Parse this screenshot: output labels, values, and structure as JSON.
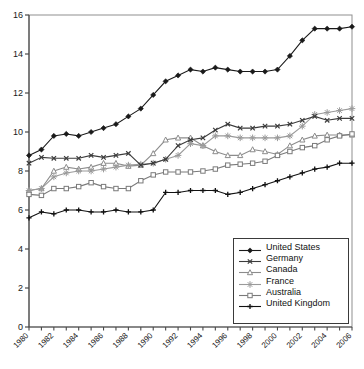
{
  "chart_data": {
    "type": "line",
    "title": "",
    "subtitle": "",
    "xlabel": "",
    "ylabel": "",
    "xlim": [
      1980,
      2006
    ],
    "ylim": [
      0,
      16
    ],
    "grid": false,
    "legend_position": "bottom-right",
    "x": [
      1980,
      1981,
      1982,
      1983,
      1984,
      1985,
      1986,
      1987,
      1988,
      1989,
      1990,
      1991,
      1992,
      1993,
      1994,
      1995,
      1996,
      1997,
      1998,
      1999,
      2000,
      2001,
      2002,
      2003,
      2004,
      2005,
      2006
    ],
    "xticks": [
      "1980",
      "1982",
      "1984",
      "1986",
      "1988",
      "1990",
      "1992",
      "1994",
      "1996",
      "1998",
      "2000",
      "2002",
      "2004",
      "2006"
    ],
    "yticks": [
      "0",
      "2",
      "4",
      "6",
      "8",
      "10",
      "12",
      "14",
      "16"
    ],
    "series": [
      {
        "name": "United States",
        "marker": "diamond",
        "color": "#1a1a1a",
        "values": [
          8.8,
          9.1,
          9.8,
          9.9,
          9.8,
          10.0,
          10.2,
          10.4,
          10.8,
          11.2,
          11.9,
          12.6,
          12.9,
          13.2,
          13.1,
          13.3,
          13.2,
          13.1,
          13.1,
          13.1,
          13.2,
          13.9,
          14.7,
          15.3,
          15.3,
          15.3,
          15.4
        ]
      },
      {
        "name": "Germany",
        "marker": "x",
        "color": "#3c3c3c",
        "values": [
          8.4,
          8.7,
          8.65,
          8.65,
          8.65,
          8.8,
          8.7,
          8.8,
          8.9,
          8.3,
          8.4,
          8.6,
          9.3,
          9.6,
          9.7,
          10.1,
          10.4,
          10.2,
          10.2,
          10.3,
          10.3,
          10.4,
          10.6,
          10.8,
          10.6,
          10.7,
          10.7
        ]
      },
      {
        "name": "Canada",
        "marker": "triangle",
        "color": "#8c8c8c",
        "values": [
          7.0,
          7.1,
          8.0,
          8.2,
          8.1,
          8.2,
          8.4,
          8.4,
          8.25,
          8.3,
          8.9,
          9.6,
          9.7,
          9.7,
          9.3,
          9.0,
          8.8,
          8.8,
          9.1,
          9.0,
          8.85,
          9.3,
          9.6,
          9.8,
          9.85,
          9.85,
          9.85
        ]
      },
      {
        "name": "France",
        "marker": "asterisk",
        "color": "#9a9a9a",
        "values": [
          7.0,
          7.1,
          7.7,
          7.9,
          8.0,
          8.0,
          8.1,
          8.2,
          8.3,
          8.35,
          8.4,
          8.6,
          8.8,
          9.4,
          9.3,
          9.8,
          9.8,
          9.7,
          9.7,
          9.7,
          9.7,
          9.8,
          10.3,
          10.9,
          11.0,
          11.1,
          11.2
        ]
      },
      {
        "name": "Australia",
        "marker": "square",
        "color": "#7a7a7a",
        "values": [
          6.8,
          6.75,
          7.1,
          7.1,
          7.2,
          7.4,
          7.2,
          7.1,
          7.1,
          7.5,
          7.8,
          7.95,
          7.95,
          7.95,
          8.0,
          8.1,
          8.3,
          8.35,
          8.4,
          8.5,
          8.8,
          9.0,
          9.2,
          9.3,
          9.6,
          9.8,
          9.9
        ]
      },
      {
        "name": "United Kingdom",
        "marker": "plus",
        "color": "#111111",
        "values": [
          5.6,
          5.9,
          5.8,
          6.0,
          6.0,
          5.9,
          5.9,
          6.0,
          5.9,
          5.9,
          6.0,
          6.9,
          6.9,
          7.0,
          7.0,
          7.0,
          6.8,
          6.9,
          7.1,
          7.3,
          7.5,
          7.7,
          7.9,
          8.1,
          8.2,
          8.4,
          8.4
        ]
      }
    ]
  },
  "legend": {
    "items": [
      {
        "label": "United States"
      },
      {
        "label": "Germany"
      },
      {
        "label": "Canada"
      },
      {
        "label": "France"
      },
      {
        "label": "Australia"
      },
      {
        "label": "United Kingdom"
      }
    ]
  }
}
